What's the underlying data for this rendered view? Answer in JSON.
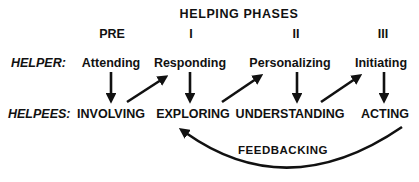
{
  "title": "HELPING PHASES",
  "phases": [
    {
      "label": "PRE"
    },
    {
      "label": "I"
    },
    {
      "label": "II"
    },
    {
      "label": "III"
    }
  ],
  "helper": {
    "row_label": "HELPER:",
    "items": [
      "Attending",
      "Responding",
      "Personalizing",
      "Initiating"
    ]
  },
  "helpees": {
    "row_label": "HELPEES:",
    "items": [
      "INVOLVING",
      "EXPLORING",
      "UNDERSTANDING",
      "ACTING"
    ]
  },
  "feedback_label": "FEEDBACKING",
  "arrows": [
    "attending-to-involving",
    "involving-to-responding",
    "responding-to-exploring",
    "exploring-to-personalizing",
    "personalizing-to-understanding",
    "understanding-to-initiating",
    "initiating-to-acting",
    "feedback-acting-to-exploring"
  ],
  "colors": {
    "background": "#ffffff",
    "ink": "#111111"
  }
}
